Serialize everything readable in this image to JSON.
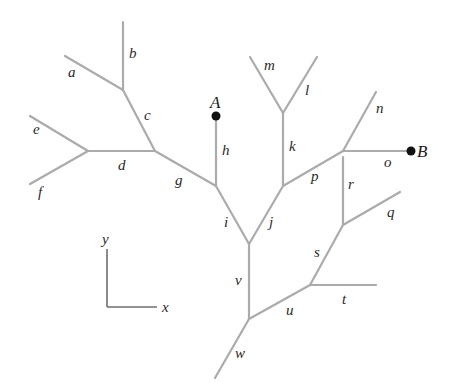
{
  "diagram": {
    "points": [
      {
        "id": "A",
        "label": "A",
        "x": 216,
        "y": 116,
        "lx": 210,
        "ly": 108
      },
      {
        "id": "B",
        "label": "B",
        "x": 411,
        "y": 151,
        "lx": 417,
        "ly": 157
      }
    ],
    "edges": [
      {
        "label": "a",
        "x1": 65,
        "y1": 56,
        "x2": 123,
        "y2": 90,
        "lx": 68,
        "ly": 77
      },
      {
        "label": "b",
        "x1": 123,
        "y1": 22,
        "x2": 123,
        "y2": 90,
        "lx": 129,
        "ly": 58
      },
      {
        "label": "c",
        "x1": 123,
        "y1": 90,
        "x2": 155,
        "y2": 151,
        "lx": 144,
        "ly": 120
      },
      {
        "label": "d",
        "x1": 88,
        "y1": 151,
        "x2": 155,
        "y2": 151,
        "lx": 118,
        "ly": 170
      },
      {
        "label": "e",
        "x1": 30,
        "y1": 116,
        "x2": 88,
        "y2": 151,
        "lx": 33,
        "ly": 134
      },
      {
        "label": "f",
        "x1": 30,
        "y1": 184,
        "x2": 88,
        "y2": 151,
        "lx": 38,
        "ly": 197
      },
      {
        "label": "g",
        "x1": 155,
        "y1": 151,
        "x2": 216,
        "y2": 186,
        "lx": 175,
        "ly": 185
      },
      {
        "label": "h",
        "x1": 216,
        "y1": 116,
        "x2": 216,
        "y2": 186,
        "lx": 222,
        "ly": 155
      },
      {
        "label": "i",
        "x1": 216,
        "y1": 186,
        "x2": 249,
        "y2": 244,
        "lx": 224,
        "ly": 227
      },
      {
        "label": "j",
        "x1": 249,
        "y1": 244,
        "x2": 283,
        "y2": 186,
        "lx": 269,
        "ly": 227
      },
      {
        "label": "k",
        "x1": 283,
        "y1": 113,
        "x2": 283,
        "y2": 186,
        "lx": 289,
        "ly": 151
      },
      {
        "label": "l",
        "x1": 283,
        "y1": 113,
        "x2": 317,
        "y2": 57,
        "lx": 305,
        "ly": 95
      },
      {
        "label": "m",
        "x1": 250,
        "y1": 57,
        "x2": 283,
        "y2": 113,
        "lx": 264,
        "ly": 70
      },
      {
        "label": "n",
        "x1": 343,
        "y1": 151,
        "x2": 376,
        "y2": 92,
        "lx": 376,
        "ly": 113
      },
      {
        "label": "o",
        "x1": 343,
        "y1": 151,
        "x2": 411,
        "y2": 151,
        "lx": 384,
        "ly": 167
      },
      {
        "label": "p",
        "x1": 283,
        "y1": 186,
        "x2": 343,
        "y2": 151,
        "lx": 311,
        "ly": 181
      },
      {
        "label": "q",
        "x1": 343,
        "y1": 225,
        "x2": 400,
        "y2": 192,
        "lx": 387,
        "ly": 217
      },
      {
        "label": "r",
        "x1": 343,
        "y1": 157,
        "x2": 343,
        "y2": 225,
        "lx": 348,
        "ly": 189
      },
      {
        "label": "s",
        "x1": 310,
        "y1": 285,
        "x2": 343,
        "y2": 225,
        "lx": 314,
        "ly": 257
      },
      {
        "label": "t",
        "x1": 310,
        "y1": 285,
        "x2": 376,
        "y2": 285,
        "lx": 342,
        "ly": 304
      },
      {
        "label": "u",
        "x1": 249,
        "y1": 319,
        "x2": 310,
        "y2": 285,
        "lx": 286,
        "ly": 315
      },
      {
        "label": "v",
        "x1": 249,
        "y1": 244,
        "x2": 249,
        "y2": 319,
        "lx": 235,
        "ly": 285
      },
      {
        "label": "w",
        "x1": 215,
        "y1": 378,
        "x2": 249,
        "y2": 319,
        "lx": 235,
        "ly": 358
      }
    ],
    "axes": {
      "origin": {
        "x": 107,
        "y": 307
      },
      "x_end": {
        "x": 157,
        "y": 307
      },
      "y_end": {
        "x": 107,
        "y": 249
      },
      "x_label": "x",
      "y_label": "y",
      "x_label_pos": {
        "x": 162,
        "y": 312
      },
      "y_label_pos": {
        "x": 102,
        "y": 244
      }
    },
    "colors": {
      "edge": "#ababab",
      "axis": "#6e6e6e",
      "point": "#111111",
      "text": "#2a2a2a"
    }
  }
}
